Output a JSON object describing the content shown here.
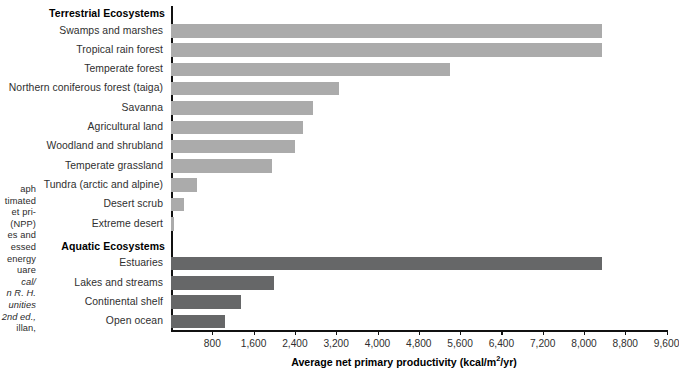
{
  "caption": {
    "lines": [
      "aph",
      "timated",
      "et pri-",
      " (NPP)",
      "es and",
      "essed",
      "energy",
      "uare",
      "cal/",
      "n R. H.",
      "unities",
      "2nd ed.,",
      "illan,"
    ]
  },
  "chart_data": {
    "type": "bar",
    "orientation": "horizontal",
    "title": "",
    "xlabel": "Average net primary productivity (kcal/m2/yr)",
    "xlabel_parts": {
      "text": "Average net primary productivity (kcal/m",
      "sup": "2",
      "tail": "/yr)"
    },
    "ylabel": "",
    "xlim": [
      0,
      9600
    ],
    "xticks": [
      800,
      1600,
      2400,
      3200,
      4000,
      4800,
      5600,
      6400,
      7200,
      8000,
      8800,
      9600
    ],
    "xticklabels": [
      "800",
      "1,600",
      "2,400",
      "3,200",
      "4,000",
      "4,800",
      "5,600",
      "6,400",
      "7,200",
      "8,000",
      "8,800",
      "9,600"
    ],
    "grid": false,
    "legend": false,
    "groups": [
      {
        "name": "Terrestrial Ecosystems",
        "color": "#ababab",
        "categories": [
          "Swamps and marshes",
          "Tropical rain forest",
          "Temperate forest",
          "Northern coniferous forest (taiga)",
          "Savanna",
          "Agricultural land",
          "Woodland and shrubland",
          "Temperate grassland",
          "Tundra (arctic and alpine)",
          "Desert scrub",
          "Extreme desert"
        ],
        "values": [
          8350,
          8350,
          5400,
          3250,
          2750,
          2550,
          2400,
          1950,
          500,
          250,
          60
        ]
      },
      {
        "name": "Aquatic Ecosystems",
        "color": "#666768",
        "categories": [
          "Estuaries",
          "Lakes and streams",
          "Continental shelf",
          "Open ocean"
        ],
        "values": [
          8350,
          2000,
          1350,
          1050
        ]
      }
    ]
  }
}
